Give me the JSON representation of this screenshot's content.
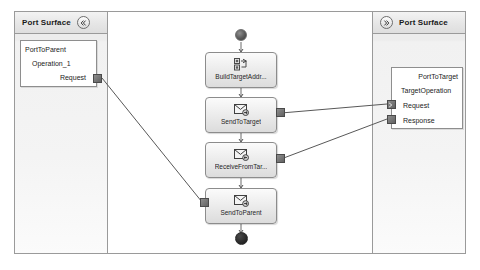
{
  "diagram": {
    "colors": {
      "canvas_border": "#9a9a9a",
      "lane_background": "#f2f2f2",
      "node_fill": "#ededed",
      "node_border": "#8c8c8c",
      "port_square": "#6b6b6b",
      "connector": "#4f4f4f",
      "end_node": "#1d1d1d"
    },
    "lanes": [
      {
        "id": "left-lane",
        "title": "Port Surface",
        "icon": "collapse-left-icon",
        "icon_position": "after-title"
      },
      {
        "id": "right-lane",
        "title": "Port Surface",
        "icon": "collapse-right-icon",
        "icon_position": "before-title"
      }
    ],
    "port_boxes": [
      {
        "id": "port-to-parent",
        "name": "PortToParent",
        "operation": "Operation_1",
        "messages": [
          {
            "label": "Request",
            "port_glyph": "plain"
          }
        ]
      },
      {
        "id": "port-to-target",
        "name": "PortToTarget",
        "operation": "TargetOperation",
        "messages": [
          {
            "label": "Request",
            "port_glyph": "arrow"
          },
          {
            "label": "Response",
            "port_glyph": "plain"
          }
        ]
      }
    ],
    "nodes": [
      {
        "id": "start",
        "type": "start-node",
        "label": ""
      },
      {
        "id": "build-target-addr",
        "type": "activity",
        "label": "BuildTargetAddr...",
        "icon": "assign-icon"
      },
      {
        "id": "send-to-target",
        "type": "activity",
        "label": "SendToTarget",
        "icon": "send-message-icon"
      },
      {
        "id": "receive-from-target",
        "type": "activity",
        "label": "ReceiveFromTar...",
        "icon": "receive-message-icon"
      },
      {
        "id": "send-to-parent",
        "type": "activity",
        "label": "SendToParent",
        "icon": "send-message-icon"
      },
      {
        "id": "end",
        "type": "end-node",
        "label": ""
      }
    ],
    "flow_sequence": [
      "start",
      "build-target-addr",
      "send-to-target",
      "receive-from-target",
      "send-to-parent",
      "end"
    ],
    "connections": [
      {
        "from": "port-to-parent.Request",
        "to": "send-to-parent.left-port"
      },
      {
        "from": "send-to-target.right-port",
        "to": "port-to-target.Request"
      },
      {
        "from": "receive-from-target.right-port",
        "to": "port-to-target.Response"
      }
    ]
  }
}
